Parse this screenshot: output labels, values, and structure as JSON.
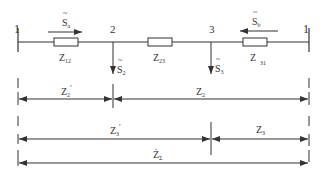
{
  "nodes": {
    "left_bus": "1",
    "node2": "2",
    "node3": "3",
    "right_bus": "1"
  },
  "flows": {
    "sa": {
      "symbol": "S",
      "sub": "a"
    },
    "sb": {
      "symbol": "S",
      "sub": "b"
    },
    "s2": {
      "symbol": "S",
      "sub": "2"
    },
    "s3": {
      "symbol": "S",
      "sub": "3"
    }
  },
  "impedances": {
    "z12": {
      "symbol": "Z",
      "sub": "12"
    },
    "z23": {
      "symbol": "Z",
      "sub": "23"
    },
    "z31": {
      "symbol": "Z",
      "sub": "31"
    }
  },
  "dimensions": {
    "z2p": {
      "symbol": "Z",
      "sub": "2",
      "prime": "′"
    },
    "z2": {
      "symbol": "Z",
      "sub": "2"
    },
    "z3p": {
      "symbol": "Z",
      "sub": "3",
      "prime": "′"
    },
    "z3": {
      "symbol": "Z",
      "sub": "3"
    },
    "zsum": {
      "symbol": "Ż",
      "sub": "Σ"
    }
  },
  "colors": {
    "line": "#333333",
    "background": "#ffffff"
  }
}
